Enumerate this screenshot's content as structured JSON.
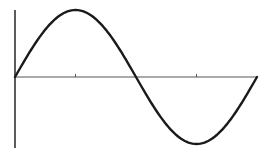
{
  "chart_data": {
    "type": "line",
    "title": "",
    "xlabel": "",
    "ylabel": "",
    "series": [
      {
        "name": "sin(x)",
        "x": [
          0,
          0.5236,
          1.0472,
          1.5708,
          2.0944,
          2.618,
          3.1416,
          3.6652,
          4.1888,
          4.7124,
          5.236,
          5.7596,
          6.2832
        ],
        "values": [
          0,
          0.5,
          0.866,
          1,
          0.866,
          0.5,
          0,
          -0.5,
          -0.866,
          -1,
          -0.866,
          -0.5,
          0
        ]
      }
    ],
    "xlim": [
      0,
      6.2832
    ],
    "ylim": [
      -1,
      1
    ],
    "x_ticks": [
      1.5708,
      3.1416,
      4.7124
    ],
    "x_tick_labels": [],
    "grid": false,
    "legend": null
  },
  "colors": {
    "curve": "#1a1a1a",
    "axis": "#333333",
    "background": "#ffffff"
  },
  "layout": {
    "origin_x": 15,
    "origin_y": 77,
    "x_end": 257,
    "amplitude_px": 67,
    "y_axis_top": 10,
    "y_axis_bottom": 148,
    "tick_half": 3
  }
}
